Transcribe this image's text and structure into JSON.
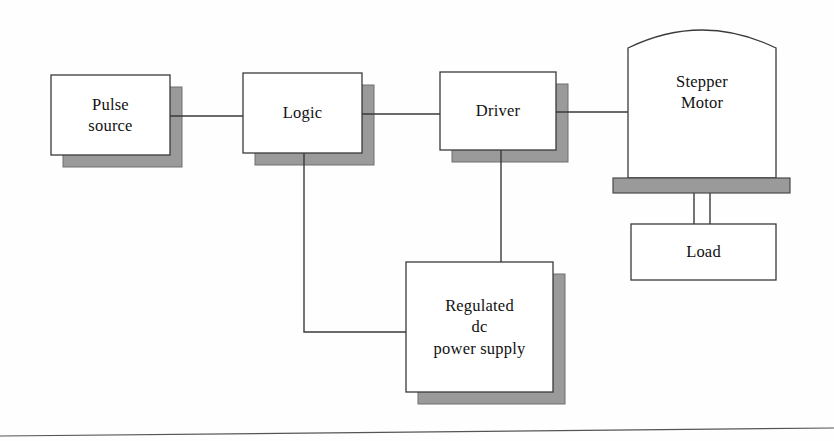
{
  "diagram": {
    "background_color": "#fefefe",
    "line_color": "#3a3a3a",
    "box_fill": "#ffffff",
    "box_border_color": "#3a3a3a",
    "shadow_color": "#9a9a9a",
    "shadow_border_color": "#6f6f6f",
    "text_color": "#111111",
    "blocks": [
      {
        "id": "pulse-source",
        "name": "Pulse source",
        "lines": [
          "Pulse",
          "source"
        ],
        "shape": "rect-shadow",
        "x": 51,
        "y": 75,
        "w": 119,
        "h": 80
      },
      {
        "id": "logic",
        "name": "Logic",
        "lines": [
          "Logic"
        ],
        "shape": "rect-shadow",
        "x": 243,
        "y": 73,
        "w": 119,
        "h": 80
      },
      {
        "id": "driver",
        "name": "Driver",
        "lines": [
          "Driver"
        ],
        "shape": "rect-shadow",
        "x": 440,
        "y": 72,
        "w": 116,
        "h": 78
      },
      {
        "id": "stepper-motor",
        "name": "Stepper Motor",
        "lines": [
          "Stepper",
          "Motor"
        ],
        "shape": "arched-top",
        "x": 628,
        "y": 18,
        "w": 148,
        "h": 160
      },
      {
        "id": "motor-base",
        "name": "Motor mounting base",
        "lines": [],
        "shape": "gray-bar",
        "x": 613,
        "y": 178,
        "w": 177,
        "h": 15
      },
      {
        "id": "load",
        "name": "Load",
        "lines": [
          "Load"
        ],
        "shape": "rect-plain",
        "x": 631,
        "y": 224,
        "w": 145,
        "h": 56
      },
      {
        "id": "regulated-dc-power-supply",
        "name": "Regulated dc power supply",
        "lines": [
          "Regulated",
          "dc",
          "power supply"
        ],
        "shape": "rect-shadow",
        "x": 406,
        "y": 262,
        "w": 147,
        "h": 130
      }
    ],
    "connections": [
      {
        "id": "pulse-to-logic",
        "from": "pulse-source",
        "to": "logic",
        "kind": "horizontal"
      },
      {
        "id": "logic-to-driver",
        "from": "logic",
        "to": "driver",
        "kind": "horizontal"
      },
      {
        "id": "driver-to-motor",
        "from": "driver",
        "to": "stepper-motor",
        "kind": "horizontal"
      },
      {
        "id": "logic-to-power-supply",
        "from": "logic",
        "to": "regulated-dc-power-supply",
        "kind": "elbow"
      },
      {
        "id": "driver-to-power-supply",
        "from": "driver",
        "to": "regulated-dc-power-supply",
        "kind": "vertical"
      },
      {
        "id": "motor-shaft-to-load",
        "from": "motor-base",
        "to": "load",
        "kind": "shaft"
      }
    ],
    "page_rule": {
      "name": "page-bottom-rule",
      "x1": 0,
      "y1": 436,
      "x2": 834,
      "y2": 428
    }
  }
}
